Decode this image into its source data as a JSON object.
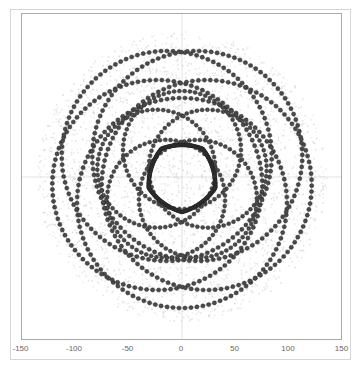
{
  "chart_data": {
    "type": "scatter",
    "title": "",
    "xlabel": "",
    "ylabel": "",
    "xlim": [
      -150,
      150
    ],
    "ylim": [
      -152,
      152
    ],
    "grid": false,
    "legend": null,
    "x_ticks": [
      "-150",
      "-100",
      "-50",
      "0",
      "50",
      "100",
      "150"
    ],
    "x_tick_values": [
      -150,
      -100,
      -50,
      0,
      50,
      100,
      150
    ],
    "series": [
      {
        "name": "outer-circles",
        "count": 5,
        "radius": 105,
        "center_offset": 26,
        "phase_deg": 90,
        "points_per_circle": 110,
        "color": "#4a4a4a"
      },
      {
        "name": "medium-circles",
        "count": 5,
        "radius": 59,
        "center_offset": 27,
        "phase_deg": -90,
        "points_per_circle": 70,
        "color": "#4a4a4a"
      },
      {
        "name": "flower-outline",
        "lobes": 5,
        "inner_radius": 33,
        "outer_radius": 52,
        "points": 360,
        "color": "#333333"
      },
      {
        "name": "halo",
        "radius": 145,
        "points": 2600,
        "color": "#c8c8c8"
      }
    ]
  },
  "axis": {
    "center_px": [
      181,
      176
    ],
    "px_per_unit": 1.07
  }
}
